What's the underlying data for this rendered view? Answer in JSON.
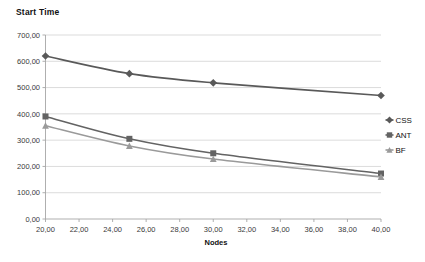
{
  "chart_data": {
    "type": "line",
    "title": "Start Time",
    "xlabel": "Nodes",
    "ylabel": "",
    "x": [
      20,
      25,
      30,
      40
    ],
    "xlim": [
      20,
      40
    ],
    "ylim": [
      0,
      700
    ],
    "grid": true,
    "legend_position": "right",
    "xticks": [
      "20,00",
      "22,00",
      "24,00",
      "26,00",
      "28,00",
      "30,00",
      "32,00",
      "34,00",
      "36,00",
      "38,00",
      "40,00"
    ],
    "xtick_values": [
      20,
      22,
      24,
      26,
      28,
      30,
      32,
      34,
      36,
      38,
      40
    ],
    "yticks": [
      "0,00",
      "100,00",
      "200,00",
      "300,00",
      "400,00",
      "500,00",
      "600,00",
      "700,00"
    ],
    "ytick_values": [
      0,
      100,
      200,
      300,
      400,
      500,
      600,
      700
    ],
    "series": [
      {
        "name": "CSS",
        "marker": "diamond",
        "color": "#595959",
        "values": [
          620,
          553,
          518,
          470
        ]
      },
      {
        "name": "ANT",
        "marker": "square",
        "color": "#636363",
        "values": [
          390,
          305,
          250,
          173
        ]
      },
      {
        "name": "BF",
        "marker": "triangle",
        "color": "#9a9a9a",
        "values": [
          355,
          278,
          228,
          160
        ]
      }
    ]
  },
  "legend": {
    "items": [
      {
        "label": "CSS",
        "marker": "diamond",
        "color": "#595959"
      },
      {
        "label": "ANT",
        "marker": "square",
        "color": "#636363"
      },
      {
        "label": "BF",
        "marker": "triangle",
        "color": "#9a9a9a"
      }
    ]
  }
}
